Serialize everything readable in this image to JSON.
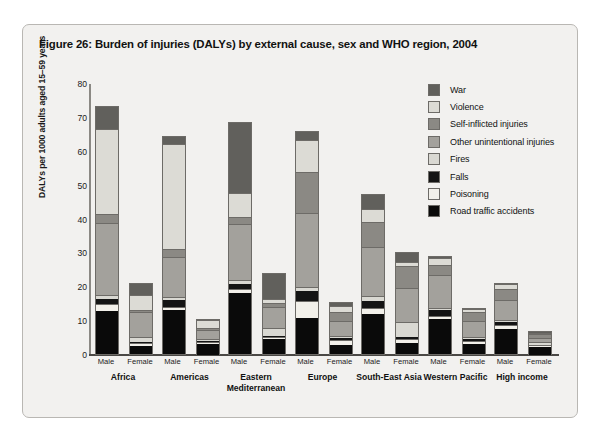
{
  "figure": {
    "title": "Figure 26: Burden of injuries (DALYs) by external cause, sex and WHO region, 2004"
  },
  "chart_data": {
    "type": "bar",
    "subtype": "stacked-grouped",
    "title": "Figure 26: Burden of injuries (DALYs) by external cause, sex and WHO region, 2004",
    "xlabel": "",
    "ylabel": "DALYs per 1000 adults aged 15–59 years",
    "ylim": [
      0,
      80
    ],
    "yticks": [
      0,
      10,
      20,
      30,
      40,
      50,
      60,
      70,
      80
    ],
    "grid": false,
    "legend_position": "right",
    "categories": [
      "Africa",
      "Americas",
      "Eastern Mediterranean",
      "Europe",
      "South-East Asia",
      "Western Pacific",
      "High income"
    ],
    "subcategories": [
      "Male",
      "Female"
    ],
    "series": [
      {
        "name": "Road traffic accidents",
        "color": "#0a0a0a",
        "values": {
          "Africa": {
            "Male": 12.6,
            "Female": 2.4
          },
          "Americas": {
            "Male": 13.0,
            "Female": 3.3
          },
          "Eastern Mediterranean": {
            "Male": 18.0,
            "Female": 4.4
          },
          "Europe": {
            "Male": 10.7,
            "Female": 2.7
          },
          "South-East Asia": {
            "Male": 11.8,
            "Female": 3.2
          },
          "Western Pacific": {
            "Male": 10.2,
            "Female": 3.2
          },
          "High income": {
            "Male": 7.5,
            "Female": 2.3
          }
        }
      },
      {
        "name": "Poisoning",
        "color": "#f2f0ea",
        "values": {
          "Africa": {
            "Male": 1.8,
            "Female": 0.6
          },
          "Americas": {
            "Male": 0.5,
            "Female": 0.2
          },
          "Eastern Mediterranean": {
            "Male": 1.0,
            "Female": 0.3
          },
          "Europe": {
            "Male": 4.6,
            "Female": 1.1
          },
          "South-East Asia": {
            "Male": 1.5,
            "Female": 0.8
          },
          "Western Pacific": {
            "Male": 0.7,
            "Female": 0.4
          },
          "High income": {
            "Male": 0.8,
            "Female": 0.3
          }
        }
      },
      {
        "name": "Falls",
        "color": "#141414",
        "values": {
          "Africa": {
            "Male": 1.8,
            "Female": 0.5
          },
          "Americas": {
            "Male": 2.6,
            "Female": 0.5
          },
          "Eastern Mediterranean": {
            "Male": 1.8,
            "Female": 0.7
          },
          "Europe": {
            "Male": 3.4,
            "Female": 0.9
          },
          "South-East Asia": {
            "Male": 2.4,
            "Female": 0.9
          },
          "Western Pacific": {
            "Male": 2.1,
            "Female": 0.9
          },
          "High income": {
            "Male": 1.2,
            "Female": 0.5
          }
        }
      },
      {
        "name": "Fires",
        "color": "#d9d8d2",
        "values": {
          "Africa": {
            "Male": 0.8,
            "Female": 1.3
          },
          "Americas": {
            "Male": 0.3,
            "Female": 0.2
          },
          "Eastern Mediterranean": {
            "Male": 0.7,
            "Female": 2.1
          },
          "Europe": {
            "Male": 0.7,
            "Female": 0.3
          },
          "South-East Asia": {
            "Male": 1.1,
            "Female": 4.2
          },
          "Western Pacific": {
            "Male": 0.4,
            "Female": 0.5
          },
          "High income": {
            "Male": 0.3,
            "Female": 0.2
          }
        }
      },
      {
        "name": "Other unintentional injuries",
        "color": "#a3a19c",
        "values": {
          "Africa": {
            "Male": 21.5,
            "Female": 7.2
          },
          "Americas": {
            "Male": 11.8,
            "Female": 2.7
          },
          "Eastern Mediterranean": {
            "Male": 16.5,
            "Female": 6.1
          },
          "Europe": {
            "Male": 21.8,
            "Female": 4.5
          },
          "South-East Asia": {
            "Male": 14.5,
            "Female": 10.2
          },
          "Western Pacific": {
            "Male": 9.6,
            "Female": 4.5
          },
          "High income": {
            "Male": 5.9,
            "Female": 1.4
          }
        }
      },
      {
        "name": "Self-inflicted injuries",
        "color": "#8b8984",
        "values": {
          "Africa": {
            "Male": 2.5,
            "Female": 0.8
          },
          "Americas": {
            "Male": 2.4,
            "Female": 0.6
          },
          "Eastern Mediterranean": {
            "Male": 2.2,
            "Female": 1.2
          },
          "Europe": {
            "Male": 12.2,
            "Female": 2.6
          },
          "South-East Asia": {
            "Male": 7.3,
            "Female": 6.4
          },
          "Western Pacific": {
            "Male": 2.9,
            "Female": 2.8
          },
          "High income": {
            "Male": 3.1,
            "Female": 1.0
          }
        }
      },
      {
        "name": "Violence",
        "color": "#dcdbd5",
        "values": {
          "Africa": {
            "Male": 25.0,
            "Female": 4.3
          },
          "Americas": {
            "Male": 31.0,
            "Female": 2.2
          },
          "Eastern Mediterranean": {
            "Male": 7.0,
            "Female": 1.2
          },
          "Europe": {
            "Male": 9.5,
            "Female": 1.9
          },
          "South-East Asia": {
            "Male": 3.9,
            "Female": 1.1
          },
          "Western Pacific": {
            "Male": 2.2,
            "Female": 0.9
          },
          "High income": {
            "Male": 1.6,
            "Female": 0.5
          }
        }
      },
      {
        "name": "War",
        "color": "#61605c",
        "values": {
          "Africa": {
            "Male": 7.0,
            "Female": 3.5
          },
          "Americas": {
            "Male": 2.4,
            "Female": 0.3
          },
          "Eastern Mediterranean": {
            "Male": 21.0,
            "Female": 7.5
          },
          "Europe": {
            "Male": 2.6,
            "Female": 1.2
          },
          "South-East Asia": {
            "Male": 4.5,
            "Female": 3.0
          },
          "Western Pacific": {
            "Male": 0.4,
            "Female": 0.2
          },
          "High income": {
            "Male": 0.4,
            "Female": 0.2
          }
        }
      }
    ],
    "totals": {
      "Africa": {
        "Male": 73.5,
        "Female": 20.6
      },
      "Americas": {
        "Male": 64.3,
        "Female": 10.0
      },
      "Eastern Mediterranean": {
        "Male": 69.5,
        "Female": 23.5
      },
      "Europe": {
        "Male": 73.0,
        "Female": 16.2
      },
      "South-East Asia": {
        "Male": 47.0,
        "Female": 33.9
      },
      "Western Pacific": {
        "Male": 28.5,
        "Female": 15.0
      },
      "High income": {
        "Male": 20.8,
        "Female": 6.4
      }
    }
  },
  "legend": {
    "items": [
      {
        "label": "War",
        "color": "#61605c"
      },
      {
        "label": "Violence",
        "color": "#dcdbd5"
      },
      {
        "label": "Self-inflicted injuries",
        "color": "#8b8984"
      },
      {
        "label": "Other unintentional injuries",
        "color": "#a3a19c"
      },
      {
        "label": "Fires",
        "color": "#d9d8d2"
      },
      {
        "label": "Falls",
        "color": "#141414"
      },
      {
        "label": "Poisoning",
        "color": "#f2f0ea"
      },
      {
        "label": "Road traffic accidents",
        "color": "#0a0a0a"
      }
    ]
  }
}
